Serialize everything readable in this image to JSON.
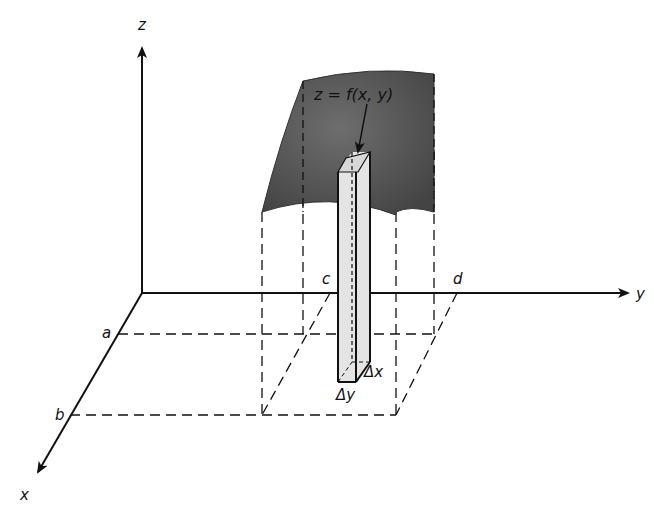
{
  "diagram": {
    "title": "z = f(x, y)",
    "axes": {
      "x": "x",
      "y": "y",
      "z": "z"
    },
    "bounds": {
      "a": "a",
      "b": "b",
      "c": "c",
      "d": "d"
    },
    "column": {
      "dx": "Δx",
      "dy": "Δy"
    },
    "colors": {
      "surface": "#5a5a5a",
      "column_fill": "#e4e4e4",
      "line": "#111111"
    }
  }
}
